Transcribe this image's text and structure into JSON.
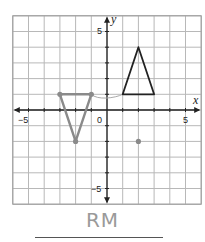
{
  "chart_data": {
    "type": "scatter",
    "title": "",
    "xlabel": "x",
    "ylabel": "y",
    "xlim": [
      -6,
      6
    ],
    "ylim": [
      -6,
      6
    ],
    "grid": true,
    "tick_labels": {
      "x": [
        "-5",
        "0",
        "5"
      ],
      "y": [
        "5",
        "-5"
      ]
    },
    "shapes": [
      {
        "name": "black-triangle",
        "color": "#222222",
        "vertices": [
          [
            1,
            1
          ],
          [
            2,
            4
          ],
          [
            3,
            1
          ]
        ]
      },
      {
        "name": "gray-triangle",
        "color": "#8a8a8a",
        "vertices": [
          [
            -3,
            1
          ],
          [
            -2,
            -2
          ],
          [
            -1,
            1
          ]
        ]
      }
    ],
    "points": [
      {
        "name": "gray-dot",
        "x": 2,
        "y": -2,
        "color": "#8a8a8a"
      },
      {
        "name": "gray-vertex-1",
        "x": -3,
        "y": 1,
        "color": "#8a8a8a"
      },
      {
        "name": "gray-vertex-2",
        "x": -2,
        "y": -2,
        "color": "#8a8a8a"
      },
      {
        "name": "gray-vertex-3",
        "x": -1,
        "y": 1,
        "color": "#8a8a8a"
      }
    ],
    "annotations": [
      {
        "name": "connector-curve",
        "from": [
          -1,
          1
        ],
        "to": [
          1,
          1
        ]
      }
    ]
  },
  "labels": {
    "x_axis": "x",
    "y_axis": "y",
    "origin": "0",
    "x_neg5": "−5",
    "x_pos5": "5",
    "y_pos5": "5",
    "y_neg5": "−5"
  },
  "answer": {
    "handwritten": "RM"
  }
}
